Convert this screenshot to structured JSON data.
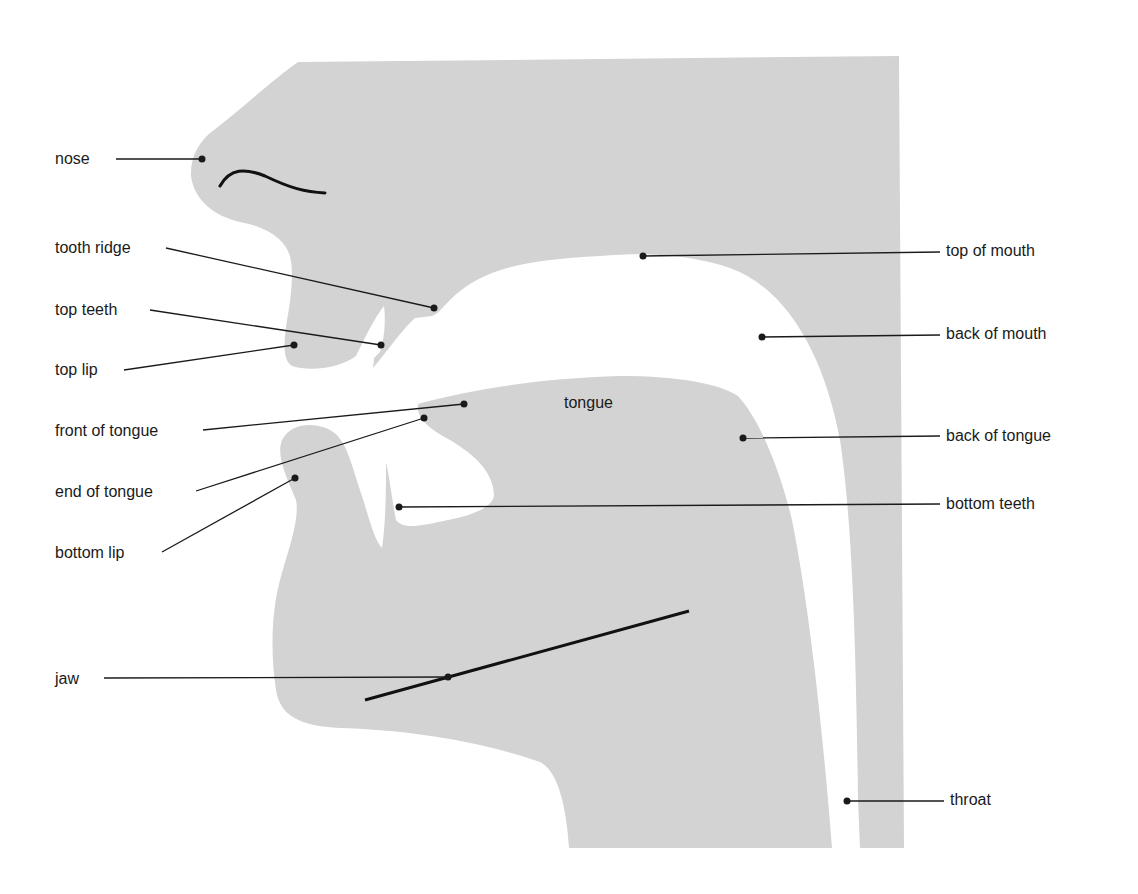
{
  "diagram": {
    "title": "",
    "colors": {
      "tissue": "#d3d3d3",
      "background": "#ffffff",
      "line": "#1a1a1a",
      "text": "#1a1a1a"
    },
    "inner_label": {
      "text": "tongue",
      "x": 564,
      "y": 394
    },
    "labels": [
      {
        "id": "nose",
        "text": "nose",
        "side": "left",
        "text_x": 55,
        "text_y": 150,
        "line_start": [
          116,
          159
        ],
        "point": [
          202,
          159
        ]
      },
      {
        "id": "tooth-ridge",
        "text": "tooth ridge",
        "side": "left",
        "text_x": 55,
        "text_y": 239,
        "line_start": [
          166,
          248
        ],
        "point": [
          434,
          308
        ]
      },
      {
        "id": "top-teeth",
        "text": "top teeth",
        "side": "left",
        "text_x": 55,
        "text_y": 301,
        "line_start": [
          150,
          310
        ],
        "point": [
          381,
          345
        ]
      },
      {
        "id": "top-lip",
        "text": "top lip",
        "side": "left",
        "text_x": 55,
        "text_y": 361,
        "line_start": [
          124,
          370
        ],
        "point": [
          294,
          345
        ]
      },
      {
        "id": "front-of-tongue",
        "text": "front of tongue",
        "side": "left",
        "text_x": 55,
        "text_y": 422,
        "line_start": [
          203,
          430
        ],
        "point": [
          464,
          404
        ]
      },
      {
        "id": "end-of-tongue",
        "text": "end of tongue",
        "side": "left",
        "text_x": 55,
        "text_y": 483,
        "line_start": [
          196,
          491
        ],
        "point": [
          424,
          418
        ]
      },
      {
        "id": "bottom-lip",
        "text": "bottom lip",
        "side": "left",
        "text_x": 55,
        "text_y": 544,
        "line_start": [
          162,
          552
        ],
        "point": [
          295,
          478
        ]
      },
      {
        "id": "jaw",
        "text": "jaw",
        "side": "left",
        "text_x": 55,
        "text_y": 670,
        "line_start": [
          104,
          678
        ],
        "point": [
          448,
          677
        ]
      },
      {
        "id": "top-of-mouth",
        "text": "top of mouth",
        "side": "right",
        "text_x": 946,
        "text_y": 242,
        "line_start": [
          940,
          252
        ],
        "point": [
          643,
          256
        ]
      },
      {
        "id": "back-of-mouth",
        "text": "back of mouth",
        "side": "right",
        "text_x": 946,
        "text_y": 325,
        "line_start": [
          940,
          335
        ],
        "point": [
          762,
          337
        ]
      },
      {
        "id": "back-of-tongue",
        "text": "back of tongue",
        "side": "right",
        "text_x": 946,
        "text_y": 427,
        "line_start": [
          940,
          436
        ],
        "point": [
          743,
          438
        ]
      },
      {
        "id": "bottom-teeth",
        "text": "bottom teeth",
        "side": "right",
        "text_x": 946,
        "text_y": 495,
        "line_start": [
          940,
          504
        ],
        "point": [
          399,
          507
        ]
      },
      {
        "id": "throat",
        "text": "throat",
        "side": "right",
        "text_x": 950,
        "text_y": 791,
        "line_start": [
          944,
          801
        ],
        "point": [
          847,
          801
        ]
      }
    ],
    "jaw_line": {
      "from": [
        365,
        700
      ],
      "to": [
        689,
        611
      ]
    },
    "nostril_curve": "M220 186 C 230 168, 245 168, 265 176 C 290 188, 305 192, 325 193"
  }
}
